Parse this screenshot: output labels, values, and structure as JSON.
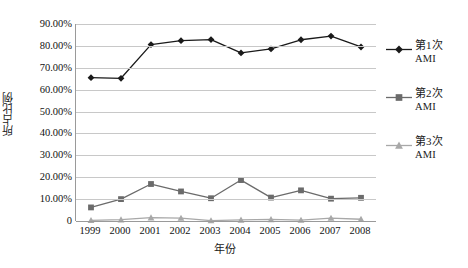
{
  "chart_data": {
    "type": "line",
    "title": "",
    "xlabel": "年份",
    "ylabel": "所占比例",
    "categories": [
      "1999",
      "2000",
      "2001",
      "2002",
      "2003",
      "2004",
      "2005",
      "2006",
      "2007",
      "2008"
    ],
    "ylim": [
      0,
      90
    ],
    "ytick_labels": [
      "90.00%",
      "80.00%",
      "70.00%",
      "60.00%",
      "50.00%",
      "40.00%",
      "30.00%",
      "20.00%",
      "10.00%",
      "0"
    ],
    "ytick_values": [
      90,
      80,
      70,
      60,
      50,
      40,
      30,
      20,
      10,
      0
    ],
    "grid": true,
    "legend_position": "right",
    "series": [
      {
        "name": "第1次AMI",
        "legend_label_main": "第1次",
        "legend_label_sub": "AMI",
        "marker": "diamond",
        "color": "#1a1a1a",
        "values": [
          65.5,
          65.2,
          80.6,
          82.4,
          82.9,
          76.8,
          78.6,
          82.8,
          84.5,
          79.5
        ]
      },
      {
        "name": "第2次AMI",
        "legend_label_main": "第2次",
        "legend_label_sub": "AMI",
        "marker": "square",
        "color": "#6b6b6b",
        "values": [
          6.2,
          10.0,
          16.9,
          13.5,
          10.4,
          18.7,
          10.7,
          14.0,
          10.2,
          10.6
        ]
      },
      {
        "name": "第3次AMI",
        "legend_label_main": "第3次",
        "legend_label_sub": "AMI",
        "marker": "triangle",
        "color": "#a8a8a8",
        "values": [
          0.3,
          0.6,
          1.5,
          1.3,
          0.2,
          0.5,
          0.7,
          0.4,
          1.3,
          0.8
        ]
      }
    ],
    "colors": {
      "series1": "#1a1a1a",
      "series2": "#6b6b6b",
      "series3": "#a8a8a8",
      "gridline": "#c8c8c8",
      "axis": "#9a9a9a",
      "background": "#ffffff"
    }
  }
}
